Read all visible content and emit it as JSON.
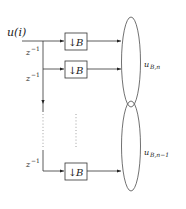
{
  "diagram": {
    "input_label": "u(i)",
    "delay_labels": [
      "z⁻¹",
      "z⁻¹",
      "z⁻¹"
    ],
    "delay_base": "z",
    "delay_exp": "−1",
    "blocks": [
      {
        "arrow": "↓",
        "label": "B"
      },
      {
        "arrow": "↓",
        "label": "B"
      },
      {
        "arrow": "↓",
        "label": "B"
      }
    ],
    "outputs": [
      {
        "base": "u",
        "sub": "B,n"
      },
      {
        "base": "u",
        "sub": "B,n−1"
      }
    ],
    "colors": {
      "stroke": "#333333",
      "text": "#222222",
      "background": "#ffffff"
    }
  }
}
